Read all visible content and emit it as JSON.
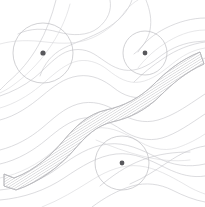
{
  "artwork": {
    "title": "Abstract Contour Map Illustration",
    "width": 205,
    "height": 207,
    "background_color": "#ffffff",
    "style": "line-art",
    "description": "Abstract topographic style artwork with flowing contour lines, a hatched diagonal band, and three circular markers with center dots"
  },
  "palette": {
    "background": "#ffffff",
    "contour_line": "#c9c9cd",
    "contour_line_faint": "#d6d6da",
    "circle_stroke": "#bdbdc2",
    "dot_fill": "#58585c",
    "band_fill": "#ffffff",
    "band_stroke": "#b4b4b9",
    "hatch_stroke": "#9a9aa0"
  },
  "band": {
    "name": "hatched-diagonal-band",
    "fill": "#ffffff",
    "stroke": "#b4b4b9",
    "hatch_angle_deg": 60,
    "hatch_spacing_px": 1.6,
    "direction": "lower-left to upper-right",
    "outline_path": "M 4 174 L 14 178 C 36 170 52 154 64 140 C 76 126 88 114 106 110 C 124 106 140 98 154 84 C 166 72 180 60 200 52 L 204 64 C 186 72 172 84 160 96 C 146 110 130 118 112 122 C 96 126 86 136 74 150 C 60 166 40 182 16 190 L 4 186 Z"
  },
  "circles": [
    {
      "name": "marker-circle-top-left",
      "cx": 43,
      "cy": 53,
      "r": 30,
      "dot_r": 2.6,
      "stroke": "#bdbdc2",
      "dot_fill": "#58585c"
    },
    {
      "name": "marker-circle-top-right",
      "cx": 145,
      "cy": 53,
      "r": 22,
      "dot_r": 2.4,
      "stroke": "#bdbdc2",
      "dot_fill": "#58585c"
    },
    {
      "name": "marker-circle-bottom-center",
      "cx": 122,
      "cy": 163,
      "r": 27,
      "dot_r": 2.4,
      "stroke": "#bdbdc2",
      "dot_fill": "#58585c"
    }
  ],
  "contour_lines": [
    {
      "name": "contour-top-1",
      "d": "M 110 0 C 112 10 108 20 98 28 C 88 36 72 36 58 32 C 44 28 30 28 18 34"
    },
    {
      "name": "contour-top-2",
      "d": "M 132 0 C 128 12 118 22 104 30 C 90 38 76 42 64 48 C 52 54 44 64 40 76"
    },
    {
      "name": "contour-top-3",
      "d": "M 0 44 C 14 40 30 40 46 42 C 62 44 78 44 92 38 C 106 32 118 22 126 10 C 130 6 134 2 138 0"
    },
    {
      "name": "contour-top-4",
      "d": "M 146 0 C 150 10 152 20 150 30 C 148 40 142 48 134 54"
    },
    {
      "name": "contour-upper-right-1",
      "d": "M 205 18 C 192 18 178 22 166 28 C 154 34 144 42 138 52"
    },
    {
      "name": "contour-upper-right-2",
      "d": "M 205 30 C 190 30 176 36 164 44 C 152 52 144 60 138 68"
    },
    {
      "name": "contour-upper-right-3",
      "d": "M 205 42 C 190 44 176 50 164 58 C 152 66 142 74 134 82"
    },
    {
      "name": "contour-mid-1",
      "d": "M 0 96 C 12 92 24 86 34 78 C 44 70 52 60 62 54 C 72 48 84 48 94 54 C 104 60 112 68 124 70 C 136 72 148 66 158 58 C 168 50 180 44 194 42 L 205 41"
    },
    {
      "name": "contour-mid-2",
      "d": "M 0 108 C 14 104 28 96 40 86 C 52 76 62 66 74 62 C 86 58 98 62 108 70 C 118 78 128 84 140 82 C 152 80 162 72 172 64 C 182 56 192 50 205 48"
    },
    {
      "name": "contour-mid-3",
      "d": "M 0 120 C 16 116 30 106 42 96 C 54 86 64 78 78 76 C 92 74 104 80 114 88 C 124 96 136 100 148 96 C 160 92 170 84 180 76 C 190 68 198 62 205 58"
    },
    {
      "name": "contour-left-vertical-1",
      "d": "M 56 0 C 52 16 46 32 38 46 C 30 60 20 72 8 82 C 4 86 2 88 0 90"
    },
    {
      "name": "contour-left-vertical-2",
      "d": "M 70 4 C 66 20 58 36 48 50 C 38 64 26 76 12 86 C 8 89 4 91 0 93"
    },
    {
      "name": "contour-below-band-1",
      "d": "M 0 150 C 16 146 30 138 42 128 C 54 118 64 108 78 104 C 92 100 106 104 118 112 C 130 120 144 124 158 120 C 172 116 184 108 196 100 L 205 94"
    },
    {
      "name": "contour-below-band-2",
      "d": "M 0 164 C 18 160 34 150 46 140 C 58 130 70 120 84 118 C 98 116 110 122 122 130 C 134 138 148 142 162 138 C 176 134 190 124 205 114"
    },
    {
      "name": "contour-below-band-3",
      "d": "M 0 178 C 20 174 38 164 52 152 C 66 140 80 130 96 128 C 112 126 126 134 140 142 C 154 150 168 152 182 146 C 192 142 199 138 205 134"
    },
    {
      "name": "contour-bottom-1",
      "d": "M 0 190 C 22 188 42 180 58 168 C 74 156 90 146 108 144 C 126 142 142 150 158 158 C 172 165 188 168 205 164"
    },
    {
      "name": "contour-bottom-2",
      "d": "M 0 200 C 24 198 46 190 64 178 C 82 166 98 156 116 154 C 134 152 150 160 166 168 C 180 175 193 178 205 176"
    },
    {
      "name": "contour-bottom-3",
      "d": "M 42 207 C 60 200 76 190 92 180 C 108 170 124 164 140 166 C 156 168 170 176 184 184 C 192 189 199 192 205 194"
    },
    {
      "name": "contour-bottom-4",
      "d": "M 92 207 C 104 198 118 190 132 186 C 146 182 160 184 172 190 C 184 196 194 200 205 202"
    },
    {
      "name": "contour-lower-right-1",
      "d": "M 205 146 C 192 148 180 154 168 162 C 156 170 144 178 130 184"
    },
    {
      "name": "contour-circle3-cross-1",
      "d": "M 96 140 C 110 146 126 152 142 156 C 158 160 174 162 190 160"
    },
    {
      "name": "contour-circle3-cross-2",
      "d": "M 100 186 C 112 176 126 166 142 160 C 158 154 174 152 190 152"
    }
  ]
}
